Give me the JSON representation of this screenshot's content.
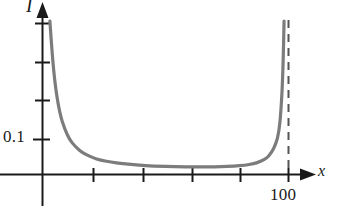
{
  "chart_data": {
    "type": "line",
    "title": "",
    "xlabel": "x",
    "ylabel": "I",
    "xlim": [
      0,
      120
    ],
    "ylim": [
      0,
      0.42
    ],
    "grid": false,
    "legend": null,
    "x_tick_labels": [
      "100"
    ],
    "y_tick_labels": [
      "0.1"
    ],
    "x_ticks_unlabeled_count": 5,
    "y_ticks_unlabeled_count": 3,
    "annotations": [
      {
        "name": "vertical-asymptote",
        "kind": "dashed-vertical-line",
        "x": 100,
        "label": "100"
      }
    ],
    "series": [
      {
        "name": "I(x)",
        "shape": "U-shaped with vertical asymptotes at both ends",
        "x": [
          3,
          4,
          5,
          6,
          7,
          8,
          10,
          12,
          15,
          18,
          22,
          26,
          30,
          36,
          42,
          50,
          58,
          65,
          70,
          75,
          80,
          84,
          87,
          90,
          92,
          94,
          95.5,
          96.5,
          97.3,
          97.8,
          98.2
        ],
        "y": [
          0.385,
          0.3,
          0.235,
          0.19,
          0.157,
          0.133,
          0.1,
          0.079,
          0.06,
          0.048,
          0.038,
          0.032,
          0.028,
          0.024,
          0.021,
          0.019,
          0.018,
          0.018,
          0.018,
          0.019,
          0.021,
          0.024,
          0.028,
          0.036,
          0.046,
          0.065,
          0.09,
          0.13,
          0.2,
          0.28,
          0.385
        ]
      }
    ],
    "curve_color": "#7c7c7c",
    "axis_color": "#1a1a1a"
  },
  "labels": {
    "y_axis": "I",
    "x_axis": "x",
    "y_tick_01": "0.1",
    "x_tick_100": "100"
  }
}
